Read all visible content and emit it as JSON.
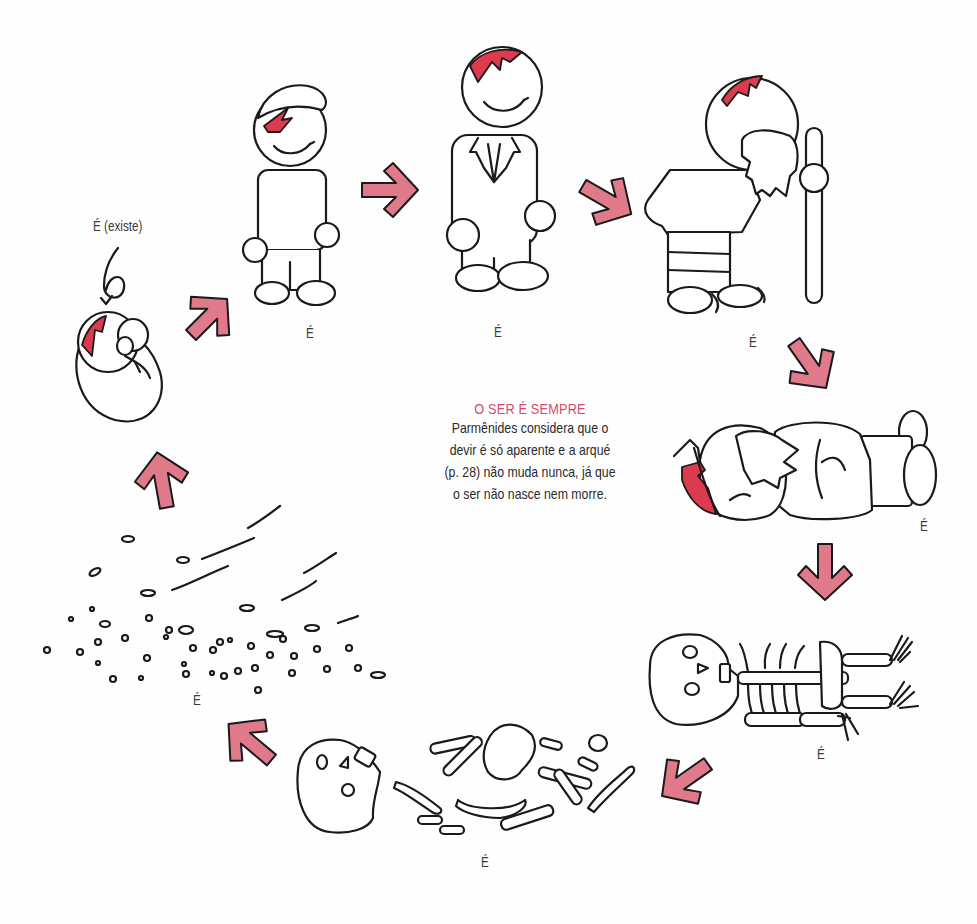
{
  "figure": {
    "title": "O SER É SEMPRE",
    "caption_lines": [
      "Parmênides considera que o",
      "devir é só aparente e a arqué",
      "(p. 28) não muda nunca, já que",
      "o ser não nasce nem morre."
    ],
    "colors": {
      "accent_title": "#d9486b",
      "arrow_fill": "#e07a8a",
      "hair_fill": "#dc3a4f",
      "ink": "#1a1a1a"
    },
    "stages": [
      {
        "id": "baby",
        "label": "É (existe)"
      },
      {
        "id": "child",
        "label": "É"
      },
      {
        "id": "adult",
        "label": "É"
      },
      {
        "id": "elder",
        "label": "É"
      },
      {
        "id": "dead-body",
        "label": "É"
      },
      {
        "id": "skeleton",
        "label": "É"
      },
      {
        "id": "scattered-bones",
        "label": "É"
      },
      {
        "id": "dust",
        "label": "É"
      }
    ],
    "arrows": [
      "up-right",
      "right",
      "down-right",
      "down-right",
      "down",
      "down-left",
      "up-left",
      "up"
    ]
  }
}
